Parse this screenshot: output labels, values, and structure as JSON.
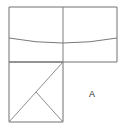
{
  "figure": {
    "title": "",
    "label_a": "A",
    "colors": {
      "background": "#ffffff",
      "outline": "#6f7173",
      "fold_line": "#7b7d7f",
      "diagonal": "#8a8c8e",
      "arc": "#77797b",
      "label": "#2b2b2b"
    },
    "geometry": {
      "top_rect": {
        "x": 9,
        "y": 7,
        "width": 108,
        "height": 55
      },
      "top_divider_x": 63,
      "bottom_square": {
        "x": 9,
        "y": 62,
        "width": 54,
        "height": 60
      },
      "arc_points": {
        "start_x": 9,
        "start_y": 38,
        "mid_x": 63,
        "mid_y": 44,
        "end_x": 117,
        "end_y": 38
      },
      "main_diagonal": {
        "x1": 9,
        "y1": 122,
        "x2": 63,
        "y2": 62
      },
      "second_diagonal": {
        "x1": 63,
        "y1": 122,
        "x2": 36,
        "y2": 92
      }
    },
    "label_position": {
      "x": 92,
      "y": 95
    }
  }
}
